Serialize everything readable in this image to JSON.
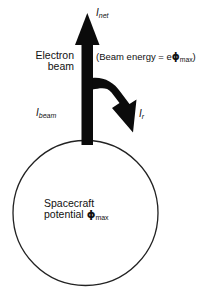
{
  "figure": {
    "background_color": "#ffffff",
    "ink_color": "#111111",
    "width": 208,
    "height": 300
  },
  "labels": {
    "net_current": {
      "symbol": "I",
      "subscript": "net",
      "full_text": "Inet"
    },
    "electron_beam": {
      "line1": "Electron",
      "line2": "beam"
    },
    "beam_energy": {
      "prefix": "(Beam energy = e",
      "phi": "ϕ",
      "subscript": "max",
      "suffix": ")",
      "full_text": "(Beam energy = eϕmax)"
    },
    "beam_current": {
      "symbol": "I",
      "subscript": "beam",
      "full_text": "Ibeam"
    },
    "return_current": {
      "symbol": "I",
      "subscript": "r",
      "full_text": "Ir"
    },
    "spacecraft_potential": {
      "line1": "Spacecraft",
      "line2_prefix": "potential ",
      "phi": "ϕ",
      "subscript": "max",
      "full_text": "Spacecraft potential ϕmax"
    }
  },
  "shapes": {
    "spacecraft_body": {
      "kind": "circle",
      "cx": 85.5,
      "cy": 213,
      "r": 72.5,
      "stroke": "#222222",
      "stroke_width": 1.2,
      "fill": "#ffffff"
    },
    "beam_arrow": {
      "kind": "arrow-up",
      "fill": "#0b0b0b",
      "from_y": 142,
      "to_y": 14,
      "shaft_x": 87,
      "shaft_width": 11
    },
    "return_arrow": {
      "kind": "curved-arrow",
      "fill": "#0b0b0b",
      "start": "shaft at y=78",
      "tip": "133,132"
    }
  }
}
